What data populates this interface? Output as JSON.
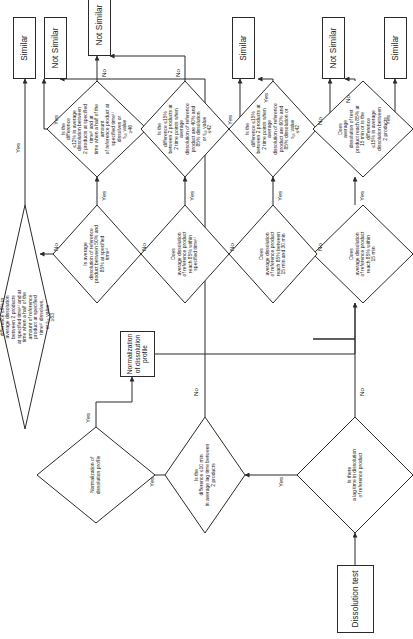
{
  "diagram": {
    "orientation": "rotated-90",
    "stroke_color": "#2a2a2a",
    "text_color": "#1c1c1c",
    "background": "#ffffff"
  },
  "nodes": {
    "start": {
      "id": "start",
      "type": "terminator",
      "label": "Dissolution test"
    },
    "d_lag": {
      "id": "d_lag",
      "type": "decision",
      "label": "Is there\na lag time in dissolution\nof reference product"
    },
    "d_lagdiff": {
      "id": "d_lagdiff",
      "type": "decision",
      "label": "Is the\ndifference ≤10 min\nin average lag time between\n2 products"
    },
    "d_norm": {
      "id": "d_norm",
      "type": "decision",
      "label": "Normalization of\ndissolution profile"
    },
    "p_norm": {
      "id": "p_norm",
      "type": "process",
      "label": "Normalization of dissolution profile"
    },
    "d_ref85_spec": {
      "id": "d_ref85_spec",
      "type": "decision",
      "label": "Does\naverage dissolution\nof reference product\nreach 85% within\nspecified time¹⁾"
    },
    "d_ref_50_85": {
      "id": "d_ref_50_85",
      "type": "decision",
      "label": "Is average\ndissolution of reference\nproduct between 50% and\n85% at specified\ntime¹⁾"
    },
    "d_diff9": {
      "id": "d_diff9",
      "type": "decision",
      "label": "Is the\ndifference ≤9% in\naverage dissolution\nbetween 2 products\nat specified time¹⁾ and at\ntime when a half of the\namount of reference\nproduct at specified\ntime¹⁾ dissolves,\nor t₅₀ value\n≥53"
    },
    "d_diff12": {
      "id": "d_diff12",
      "type": "decision",
      "label": "Is the\ndifference\n≤12% in average\ndissolution between\n2 products at specified time¹⁾ and at\ntime when a half of the amount\nof reference product at\nspecified time¹⁾\ndissolves or\nt₅₀ value\n≥46"
    },
    "d_ref85_15": {
      "id": "d_ref85_15",
      "type": "decision",
      "label": "Does\naverage dissolution\nof reference product\nreach 85% within\n15 min"
    },
    "d_ref85_15_30": {
      "id": "d_ref85_15_30",
      "type": "decision",
      "label": "Does\naverage dissolution\nof reference product\nreach 85% between\n15 min and 30 min"
    },
    "d_diff15_60_85": {
      "id": "d_diff15_60_85",
      "type": "decision",
      "label": "Is the\ndifference ≤15%\nbetween 2 products at\n2 time points when average\ndissolution of reference\nproduct are 60% and\n85% dissolution or\nt₅₀ value\n≤42"
    },
    "d_diff15_40_85": {
      "id": "d_diff15_40_85",
      "type": "decision",
      "label": "Is the\ndifference ≤15%\nbetween 2 products at\n2 time points when average\ndissolution of reference\nproduct are 40% and\n85% dissolution\nor t₅₀ value\n≤42"
    },
    "d_test85_15": {
      "id": "d_test85_15",
      "type": "decision",
      "label": "Does\naverage\ndissolution of test\nproduct reach 85% at\n15 min or is the difference\n≤15% in average\ndissolution between\n2 products"
    },
    "t_notsim_1": {
      "id": "t_notsim_1",
      "type": "terminator",
      "label": "Not Similar"
    },
    "t_sim_1": {
      "id": "t_sim_1",
      "type": "terminator",
      "label": "Similar"
    },
    "t_notsim_2": {
      "id": "t_notsim_2",
      "type": "terminator",
      "label": "Not Similar"
    },
    "t_sim_2": {
      "id": "t_sim_2",
      "type": "terminator",
      "label": "Similar"
    },
    "t_notsim_3": {
      "id": "t_notsim_3",
      "type": "terminator",
      "label": "Not Similar"
    },
    "t_sim_3": {
      "id": "t_sim_3",
      "type": "terminator",
      "label": "Similar"
    }
  },
  "edge_labels": {
    "lag_yes": "Yes",
    "lag_no": "No",
    "lagdiff_yes": "Yes",
    "lagdiff_no": "No",
    "norm_yes": "Yes",
    "norm_yes2": "Yes",
    "norm_no": "No",
    "ref85spec_yes": "Yes",
    "ref85spec_no": "No",
    "ref5085_yes": "Yes",
    "ref5085_no": "No",
    "diff9_yes": "Yes",
    "diff9_no": "No",
    "diff12_yes": "Yes",
    "diff12_no": "No",
    "ref8515_yes": "Yes",
    "ref8515_no": "No",
    "ref851530_yes": "Yes",
    "ref851530_no": "No",
    "diff15a_yes": "Yes",
    "diff15a_no": "No",
    "diff15b_yes": "Yes",
    "diff15b_no": "No",
    "test85_yes": "Yes",
    "test85_no": "No"
  },
  "palette": {
    "stroke": "#2a2a2a",
    "text": "#1c1c1c",
    "fill": "#ffffff"
  }
}
